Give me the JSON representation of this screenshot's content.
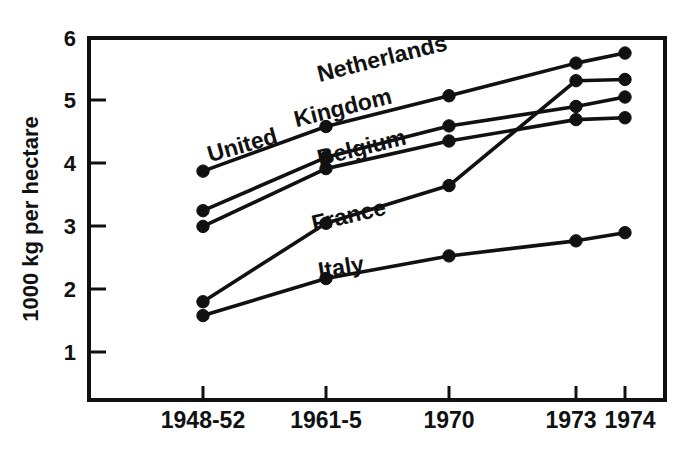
{
  "chart_data": {
    "type": "line",
    "title": "",
    "subtitle": "",
    "xlabel": "",
    "ylabel": "1000 kg per hectare",
    "categories": [
      "1948-52",
      "1961-5",
      "1970",
      "1973",
      "1974"
    ],
    "ylim": [
      0,
      6
    ],
    "yticks": [
      1,
      2,
      3,
      4,
      5,
      6
    ],
    "ytick_labels": [
      "1",
      "2",
      "3",
      "4",
      "5",
      "6"
    ],
    "grid": false,
    "legend_position": "inline-labels",
    "marker": "filled-circle",
    "series": [
      {
        "name": "Netherlands",
        "values": [
          3.88,
          4.59,
          5.08,
          5.6,
          5.76
        ],
        "label_x_frac": 0.4,
        "label_y_value": 5.3,
        "label_rotation": -14
      },
      {
        "name": "United",
        "values": [
          null,
          null,
          null,
          null,
          null
        ],
        "label_x_frac": 0.21,
        "label_y_value": 4.02,
        "label_rotation": -16,
        "part_of": "United Kingdom"
      },
      {
        "name": "Kingdom",
        "values": [
          3.25,
          4.1,
          4.6,
          4.91,
          5.06
        ],
        "label_x_frac": 0.36,
        "label_y_value": 4.58,
        "label_rotation": -14,
        "part_of": "United Kingdom"
      },
      {
        "name": "Belgium",
        "values": [
          3.0,
          3.92,
          4.36,
          4.7,
          4.73
        ],
        "label_x_frac": 0.4,
        "label_y_value": 3.96,
        "label_rotation": -14
      },
      {
        "name": "France",
        "values": [
          1.8,
          3.05,
          3.65,
          5.32,
          5.34
        ],
        "label_x_frac": 0.39,
        "label_y_value": 2.92,
        "label_rotation": -13
      },
      {
        "name": "Italy",
        "values": [
          1.58,
          2.17,
          2.53,
          2.77,
          2.9
        ],
        "label_x_frac": 0.4,
        "label_y_value": 2.17,
        "label_rotation": -9
      }
    ],
    "colors": {
      "line": "#111111",
      "marker": "#111111",
      "axis": "#111111",
      "background": "#ffffff"
    }
  },
  "yaxis": {
    "title": "1000 kg per hectare",
    "ticks": [
      "6",
      "5",
      "4",
      "3",
      "2",
      "1"
    ]
  },
  "xaxis": {
    "ticks": [
      "1948-52",
      "1961-5",
      "1970",
      "1973",
      "1974"
    ]
  },
  "series_labels": {
    "netherlands": "Netherlands",
    "united": "United",
    "kingdom": "Kingdom",
    "belgium": "Belgium",
    "france": "France",
    "italy": "Italy"
  }
}
